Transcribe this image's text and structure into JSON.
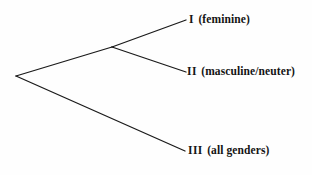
{
  "diagram": {
    "type": "tree-cladogram",
    "title": "",
    "background_color": "#fefefe",
    "line_color": "#1a1a1a",
    "text_color": "#141414",
    "nodes": [
      {
        "id": "root",
        "name": "root-node",
        "x": 16,
        "y": 76
      },
      {
        "id": "internal",
        "name": "internal-node",
        "x": 112,
        "y": 47
      },
      {
        "id": "tip1",
        "name": "tip-node-i",
        "x": 186,
        "y": 20
      },
      {
        "id": "tip2",
        "name": "tip-node-ii",
        "x": 186,
        "y": 72
      },
      {
        "id": "tip3",
        "name": "tip-node-iii",
        "x": 185,
        "y": 151
      }
    ],
    "branches": [
      {
        "id": "root-to-internal",
        "from": "root",
        "to": "internal"
      },
      {
        "id": "root-to-tip3",
        "from": "root",
        "to": "tip3"
      },
      {
        "id": "internal-to-tip1",
        "from": "internal",
        "to": "tip1"
      },
      {
        "id": "internal-to-tip2",
        "from": "internal",
        "to": "tip2"
      }
    ],
    "tips": [
      {
        "numeral": "I",
        "gloss": "(feminine)"
      },
      {
        "numeral": "II",
        "gloss": "(masculine/neuter)"
      },
      {
        "numeral": "III",
        "gloss": "(all genders)"
      }
    ]
  }
}
